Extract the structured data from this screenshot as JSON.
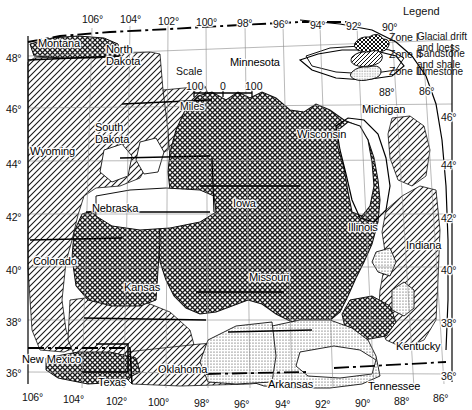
{
  "figure": {
    "domain": "map",
    "background": "#ffffff",
    "ink": "#111111",
    "width": 472,
    "height": 410
  },
  "scale_bar": {
    "title": "Scale",
    "unit_label": "Miles",
    "ticks": [
      "100",
      "0",
      "100"
    ],
    "x": 192,
    "y": 72
  },
  "legend": {
    "title": "Legend",
    "entries": [
      {
        "zone": "Zone I",
        "description": "Glacial drift\nand loess",
        "pattern": "crosshatch"
      },
      {
        "zone": "Zone II",
        "description": "Sandstone\nand shale",
        "pattern": "diagonal"
      },
      {
        "zone": "Zone III",
        "description": "Limestone",
        "pattern": "stipple"
      }
    ]
  },
  "axes": {
    "longitude_top": [
      {
        "label": "106°",
        "x": 82,
        "y": 14
      },
      {
        "label": "104°",
        "x": 120,
        "y": 14
      },
      {
        "label": "102°",
        "x": 158,
        "y": 16
      },
      {
        "label": "100°",
        "x": 196,
        "y": 17
      },
      {
        "label": "98°",
        "x": 237,
        "y": 18
      },
      {
        "label": "96°",
        "x": 273,
        "y": 19
      },
      {
        "label": "94°",
        "x": 310,
        "y": 20
      },
      {
        "label": "92°",
        "x": 346,
        "y": 21
      },
      {
        "label": "90°",
        "x": 382,
        "y": 22
      }
    ],
    "longitude_top_inset": [
      {
        "label": "88°",
        "x": 379,
        "y": 87
      },
      {
        "label": "86°",
        "x": 419,
        "y": 86
      }
    ],
    "longitude_bottom": [
      {
        "label": "106°",
        "x": 22,
        "y": 392
      },
      {
        "label": "104°",
        "x": 63,
        "y": 394
      },
      {
        "label": "102°",
        "x": 106,
        "y": 396
      },
      {
        "label": "100°",
        "x": 148,
        "y": 397
      },
      {
        "label": "98°",
        "x": 194,
        "y": 398
      },
      {
        "label": "96°",
        "x": 234,
        "y": 399
      },
      {
        "label": "94°",
        "x": 275,
        "y": 399
      },
      {
        "label": "92°",
        "x": 315,
        "y": 399
      },
      {
        "label": "90°",
        "x": 355,
        "y": 398
      },
      {
        "label": "88°",
        "x": 394,
        "y": 396
      },
      {
        "label": "86°",
        "x": 433,
        "y": 393
      }
    ],
    "latitude_left": [
      {
        "label": "48°",
        "x": 6,
        "y": 53
      },
      {
        "label": "46°",
        "x": 6,
        "y": 104
      },
      {
        "label": "44°",
        "x": 6,
        "y": 159
      },
      {
        "label": "42°",
        "x": 6,
        "y": 212
      },
      {
        "label": "40°",
        "x": 6,
        "y": 265
      },
      {
        "label": "38°",
        "x": 6,
        "y": 317
      },
      {
        "label": "36°",
        "x": 6,
        "y": 368
      }
    ],
    "latitude_right": [
      {
        "label": "46°",
        "x": 441,
        "y": 112
      },
      {
        "label": "44°",
        "x": 441,
        "y": 160
      },
      {
        "label": "42°",
        "x": 441,
        "y": 213
      },
      {
        "label": "40°",
        "x": 441,
        "y": 265
      },
      {
        "label": "38°",
        "x": 441,
        "y": 318
      },
      {
        "label": "36°",
        "x": 441,
        "y": 371
      }
    ]
  },
  "states": [
    {
      "name": "Montana",
      "x": 38,
      "y": 38,
      "multiline": false
    },
    {
      "name": "North\nDakota",
      "x": 106,
      "y": 44,
      "multiline": true
    },
    {
      "name": "Minnesota",
      "x": 230,
      "y": 57,
      "multiline": false
    },
    {
      "name": "South\nDakota",
      "x": 95,
      "y": 122,
      "multiline": true
    },
    {
      "name": "Wyoming",
      "x": 30,
      "y": 146,
      "multiline": false
    },
    {
      "name": "Wisconsin",
      "x": 297,
      "y": 129,
      "multiline": false
    },
    {
      "name": "Michigan",
      "x": 362,
      "y": 104,
      "multiline": false
    },
    {
      "name": "Nebraska",
      "x": 92,
      "y": 203,
      "multiline": false
    },
    {
      "name": "Iowa",
      "x": 233,
      "y": 198,
      "multiline": false
    },
    {
      "name": "Illinois",
      "x": 348,
      "y": 222,
      "multiline": false
    },
    {
      "name": "Indiana",
      "x": 406,
      "y": 240,
      "multiline": false
    },
    {
      "name": "Colorado",
      "x": 33,
      "y": 256,
      "multiline": false
    },
    {
      "name": "Kansas",
      "x": 124,
      "y": 282,
      "multiline": false
    },
    {
      "name": "Missouri",
      "x": 249,
      "y": 272,
      "multiline": false
    },
    {
      "name": "Kentucky",
      "x": 396,
      "y": 341,
      "multiline": false
    },
    {
      "name": "New Mexico",
      "x": 22,
      "y": 354,
      "multiline": false
    },
    {
      "name": "Oklahoma",
      "x": 158,
      "y": 364,
      "multiline": false
    },
    {
      "name": "Texas",
      "x": 98,
      "y": 377,
      "multiline": false
    },
    {
      "name": "Arkansas",
      "x": 268,
      "y": 379,
      "multiline": false
    },
    {
      "name": "Tennessee",
      "x": 368,
      "y": 381,
      "multiline": false
    }
  ]
}
